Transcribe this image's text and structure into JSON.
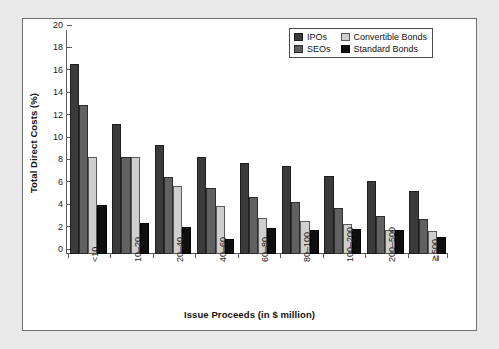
{
  "chart_data": {
    "type": "bar",
    "title": "",
    "xlabel": "Issue Proceeds (in $ million)",
    "ylabel": "Total Direct Costs (%)",
    "categories": [
      "<10",
      "10–20",
      "20–40",
      "40–60",
      "60–80",
      "80–100",
      "100–200",
      "200–500",
      "≧500"
    ],
    "series": [
      {
        "name": "IPOs",
        "color": "#3b3b3b",
        "values": [
          17.0,
          11.6,
          9.7,
          8.65,
          8.15,
          7.85,
          7.0,
          6.5,
          5.65
        ]
      },
      {
        "name": "SEOs",
        "color": "#616161",
        "values": [
          13.3,
          8.7,
          6.9,
          5.85,
          5.1,
          4.65,
          4.15,
          3.4,
          3.1
        ]
      },
      {
        "name": "Convertible Bonds",
        "color": "#cfcfcf",
        "values": [
          8.7,
          8.65,
          6.05,
          4.25,
          3.2,
          2.95,
          2.7,
          2.15,
          2.05
        ]
      },
      {
        "name": "Standard Bonds",
        "color": "#0f0f0f",
        "values": [
          4.4,
          2.75,
          2.4,
          1.3,
          2.3,
          2.1,
          2.25,
          2.15,
          1.55
        ]
      }
    ],
    "ylim": [
      0,
      20
    ],
    "yticks": [
      0,
      2,
      4,
      6,
      8,
      10,
      12,
      14,
      16,
      18,
      20
    ],
    "ytick_labels": [
      "0",
      "2",
      "4",
      "6",
      "8",
      "10",
      "12",
      "14",
      "16",
      "18",
      "20"
    ],
    "grid": false,
    "legend_position": "top-right",
    "legend_entries": [
      "IPOs",
      "Convertible Bonds",
      "SEOs",
      "Standard Bonds"
    ]
  }
}
